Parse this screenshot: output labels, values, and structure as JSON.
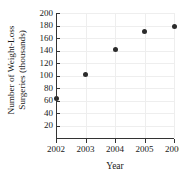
{
  "chart_data": {
    "type": "scatter",
    "title": "",
    "xlabel": "Year",
    "ylabel": "Number of Weight-Loss Surgeries (thousands)",
    "ylabel_line1": "Number of Weight-Loss",
    "ylabel_line2": "Surgeries (thousands)",
    "x": [
      2002,
      2003,
      2004,
      2005,
      2006
    ],
    "values": [
      63,
      102,
      141,
      170,
      178
    ],
    "categories": [
      "2002",
      "2003",
      "2004",
      "2005",
      "2006"
    ],
    "xlim": [
      2002,
      2006
    ],
    "ylim": [
      0,
      200
    ],
    "xticks": [
      "2002",
      "2003",
      "2004",
      "2005",
      "2006"
    ],
    "yticks": [
      "20",
      "40",
      "60",
      "80",
      "100",
      "120",
      "140",
      "160",
      "180",
      "200"
    ],
    "ytick_values": [
      20,
      40,
      60,
      80,
      100,
      120,
      140,
      160,
      180,
      200
    ],
    "grid": true,
    "legend": "none",
    "marker_color": "#2b2b2b",
    "gridline_color": "#eeeeee",
    "axis_color": "#333333",
    "text_color": "#1a1a1a",
    "background_color": "#ffffff"
  }
}
